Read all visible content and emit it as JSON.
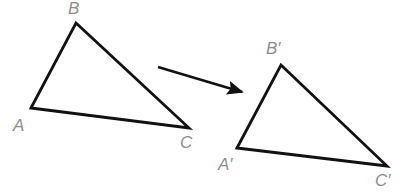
{
  "diagram": {
    "background_color": "#ffffff",
    "stroke_color": "#111111",
    "label_color": "#8d8d8d",
    "stroke_width": 2.8,
    "arrow": {
      "name": "translation-arrow",
      "from": [
        158,
        67
      ],
      "to": [
        242,
        92
      ],
      "color": "#111111"
    },
    "shapes": [
      {
        "name": "triangle-abc",
        "points": [
          [
            31,
            108
          ],
          [
            76,
            23
          ],
          [
            189,
            128
          ]
        ],
        "vertices": [
          {
            "key": "A",
            "label": "A",
            "point": [
              31,
              108
            ],
            "label_pos": [
              13,
              117
            ]
          },
          {
            "key": "B",
            "label": "B",
            "point": [
              76,
              23
            ],
            "label_pos": [
              68,
              0
            ]
          },
          {
            "key": "C",
            "label": "C",
            "point": [
              189,
              128
            ],
            "label_pos": [
              180,
              134
            ]
          }
        ]
      },
      {
        "name": "triangle-a-prime-b-prime-c-prime",
        "points": [
          [
            237,
            148
          ],
          [
            281,
            65
          ],
          [
            387,
            166
          ]
        ],
        "vertices": [
          {
            "key": "Ap",
            "label": "A′",
            "point": [
              237,
              148
            ],
            "label_pos": [
              218,
              156
            ]
          },
          {
            "key": "Bp",
            "label": "B′",
            "point": [
              281,
              65
            ],
            "label_pos": [
              266,
              40
            ]
          },
          {
            "key": "Cp",
            "label": "C′",
            "point": [
              387,
              166
            ],
            "label_pos": [
              375,
              172
            ]
          }
        ]
      }
    ]
  }
}
